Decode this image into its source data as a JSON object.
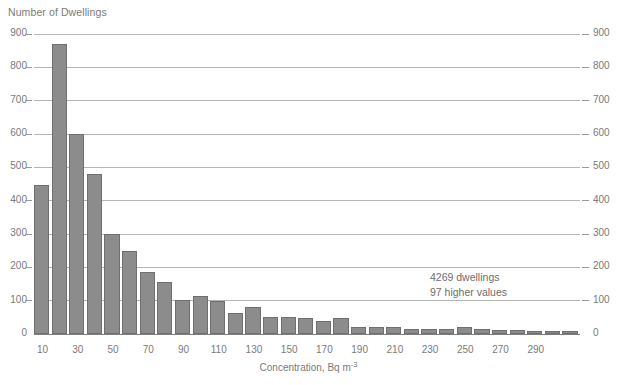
{
  "chart_data": {
    "type": "bar",
    "title": "",
    "ylabel": "Number of Dwellings",
    "xlabel": "Concentration, Bq m",
    "xlabel_exponent": "-3",
    "ylim": [
      0,
      900
    ],
    "y_ticks": [
      0,
      100,
      200,
      300,
      400,
      500,
      600,
      700,
      800,
      900
    ],
    "y_ticks_right": [
      0,
      100,
      200,
      300,
      400,
      500,
      600,
      700,
      800,
      900
    ],
    "grid": "horizontal",
    "legend": "none",
    "bin_width": 10,
    "categories": [
      10,
      20,
      30,
      40,
      50,
      60,
      70,
      80,
      90,
      100,
      110,
      120,
      130,
      140,
      150,
      160,
      170,
      180,
      190,
      200,
      210,
      220,
      230,
      240,
      250,
      260,
      270,
      280,
      290,
      300,
      310
    ],
    "x_tick_labels": [
      "10",
      "30",
      "50",
      "70",
      "90",
      "110",
      "130",
      "150",
      "170",
      "190",
      "210",
      "230",
      "250",
      "270",
      "290"
    ],
    "values": [
      447,
      870,
      600,
      480,
      300,
      250,
      185,
      155,
      103,
      115,
      100,
      62,
      80,
      50,
      50,
      48,
      38,
      48,
      22,
      20,
      20,
      14,
      15,
      14,
      22,
      16,
      12,
      12,
      10,
      10,
      9
    ],
    "bar_color": "#8c8c8c",
    "bar_edge_color": "#6f6f6f",
    "annotations": [
      "4269 dwellings",
      "97 higher values"
    ]
  }
}
